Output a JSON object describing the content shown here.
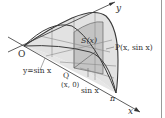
{
  "figure": {
    "labels": {
      "y_axis": "y",
      "x_axis": "x",
      "origin": "O",
      "pi": "π",
      "section_area": "S(x)",
      "point_p": "P(x, sin x)",
      "curve": "y=sin x",
      "point_q": "Q",
      "point_q_coords": "(x, 0)",
      "side_length": "sin x"
    },
    "colors": {
      "shade_light": "#e2e2e2",
      "shade_dark": "#c4c4c4",
      "line": "#3a3a3a",
      "grid": "#8a8a8a",
      "border": "#9a9a9a"
    }
  }
}
